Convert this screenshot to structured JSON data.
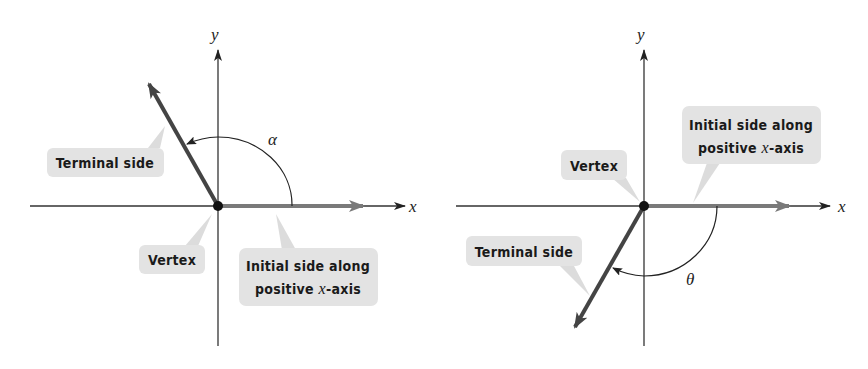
{
  "figures": [
    {
      "name": "positive-angle",
      "axes": {
        "x_label": "x",
        "y_label": "y"
      },
      "angle_label": "α",
      "callouts": {
        "terminal": "Terminal side",
        "vertex": "Vertex",
        "initial_line1": "Initial side along",
        "initial_line2_prefix": "positive ",
        "initial_line2_var": "x",
        "initial_line2_suffix": "-axis"
      }
    },
    {
      "name": "negative-angle",
      "axes": {
        "x_label": "x",
        "y_label": "y"
      },
      "angle_label": "θ",
      "callouts": {
        "terminal": "Terminal side",
        "vertex": "Vertex",
        "initial_line1": "Initial side along",
        "initial_line2_prefix": "positive ",
        "initial_line2_var": "x",
        "initial_line2_suffix": "-axis"
      }
    }
  ],
  "colors": {
    "axis": "#333333",
    "ray": "#444444",
    "initial_ray": "#777777",
    "callout_bg": "#e3e3e3",
    "pointer": "#d6d6d6"
  }
}
